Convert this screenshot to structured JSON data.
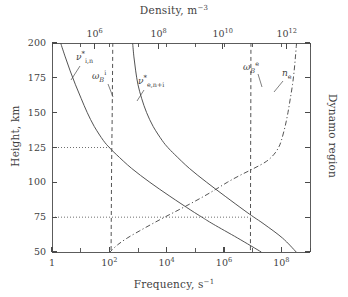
{
  "figure": {
    "background_color": "#ffffff",
    "line_color": "#4a4a4a",
    "text_color": "#3f3f3f"
  },
  "chart_data": {
    "type": "line",
    "title": "",
    "xlabel": "Frequency, s−1",
    "ylabel": "Height, km",
    "xscale": "log",
    "xlim": [
      1,
      1000000000
    ],
    "ylim": [
      50,
      200
    ],
    "grid": false,
    "legend": "inline-annotations",
    "bottom_axis": {
      "label_text": "Frequency, s",
      "label_exponent": "−1",
      "ticks": [
        {
          "value": 1,
          "label_mantissa": "1",
          "label_exponent": ""
        },
        {
          "value": 100,
          "label_mantissa": "10",
          "label_exponent": "2"
        },
        {
          "value": 10000,
          "label_mantissa": "10",
          "label_exponent": "4"
        },
        {
          "value": 1000000,
          "label_mantissa": "10",
          "label_exponent": "6"
        },
        {
          "value": 100000000,
          "label_mantissa": "10",
          "label_exponent": "8"
        }
      ]
    },
    "top_axis": {
      "label_text": "Density, m",
      "label_exponent": "−3",
      "ticks": [
        {
          "value": 1000000,
          "label_mantissa": "10",
          "label_exponent": "6"
        },
        {
          "value": 100000000,
          "label_mantissa": "10",
          "label_exponent": "8"
        },
        {
          "value": 10000000000,
          "label_mantissa": "10",
          "label_exponent": "10"
        },
        {
          "value": 1000000000000,
          "label_mantissa": "10",
          "label_exponent": "12"
        }
      ]
    },
    "left_axis": {
      "label": "Height, km",
      "ticks": [
        50,
        75,
        100,
        125,
        150,
        175,
        200
      ]
    },
    "right_axis": {
      "label": "Dynamo region"
    },
    "series": [
      {
        "name": "nu_i_n",
        "label_mantissa": "ν",
        "label_star": "*",
        "label_sub": "i,n",
        "style": "solid",
        "description": "ion-neutral collision frequency",
        "points": [
          {
            "height": 200,
            "freq": 2.0
          },
          {
            "height": 190,
            "freq": 2.9
          },
          {
            "height": 180,
            "freq": 4.3
          },
          {
            "height": 170,
            "freq": 6.6
          },
          {
            "height": 160,
            "freq": 10.5
          },
          {
            "height": 150,
            "freq": 17
          },
          {
            "height": 140,
            "freq": 30
          },
          {
            "height": 130,
            "freq": 62
          },
          {
            "height": 125,
            "freq": 100
          },
          {
            "height": 120,
            "freq": 175
          },
          {
            "height": 110,
            "freq": 600
          },
          {
            "height": 100,
            "freq": 2600
          },
          {
            "height": 90,
            "freq": 13000
          },
          {
            "height": 80,
            "freq": 70000
          },
          {
            "height": 75,
            "freq": 170000
          },
          {
            "height": 70,
            "freq": 420000
          },
          {
            "height": 60,
            "freq": 3000000
          },
          {
            "height": 50,
            "freq": 20000000
          }
        ]
      },
      {
        "name": "nu_e_n_i",
        "label_mantissa": "ν",
        "label_star": "*",
        "label_sub": "e,n+i",
        "style": "solid",
        "description": "electron collision frequency with neutrals and ions",
        "points": [
          {
            "height": 200,
            "freq": 650
          },
          {
            "height": 190,
            "freq": 720
          },
          {
            "height": 180,
            "freq": 830
          },
          {
            "height": 170,
            "freq": 1000
          },
          {
            "height": 160,
            "freq": 1350
          },
          {
            "height": 150,
            "freq": 2000
          },
          {
            "height": 140,
            "freq": 3400
          },
          {
            "height": 130,
            "freq": 7000
          },
          {
            "height": 125,
            "freq": 11000
          },
          {
            "height": 120,
            "freq": 19000
          },
          {
            "height": 110,
            "freq": 62000
          },
          {
            "height": 100,
            "freq": 250000
          },
          {
            "height": 90,
            "freq": 1100000
          },
          {
            "height": 80,
            "freq": 5000000
          },
          {
            "height": 75,
            "freq": 11000000
          },
          {
            "height": 70,
            "freq": 25000000
          },
          {
            "height": 60,
            "freq": 110000000
          },
          {
            "height": 50,
            "freq": 330000000
          }
        ]
      },
      {
        "name": "omega_B_i",
        "label_mantissa": "ω",
        "label_sub_scr": "B",
        "label_sup": "i",
        "style": "dashed",
        "description": "ion gyrofrequency",
        "constant_freq": 120,
        "points": [
          {
            "height": 200,
            "freq": 132
          },
          {
            "height": 150,
            "freq": 126
          },
          {
            "height": 125,
            "freq": 122
          },
          {
            "height": 100,
            "freq": 119
          },
          {
            "height": 75,
            "freq": 117
          },
          {
            "height": 50,
            "freq": 115
          }
        ]
      },
      {
        "name": "omega_B_e",
        "label_mantissa": "ω",
        "label_sub_scr": "B",
        "label_sup": "e",
        "style": "dashed",
        "description": "electron gyrofrequency",
        "constant_freq": 8500000,
        "points": [
          {
            "height": 200,
            "freq": 8700000
          },
          {
            "height": 150,
            "freq": 8600000
          },
          {
            "height": 125,
            "freq": 8500000
          },
          {
            "height": 100,
            "freq": 8450000
          },
          {
            "height": 75,
            "freq": 8400000
          },
          {
            "height": 50,
            "freq": 8350000
          }
        ]
      },
      {
        "name": "n_e",
        "label_mantissa": "n",
        "label_sub": "e",
        "style": "dash-dot",
        "description": "electron density, read against top Density axis",
        "points": [
          {
            "height": 200,
            "freq": 340000000
          },
          {
            "height": 190,
            "freq": 310000000
          },
          {
            "height": 180,
            "freq": 280000000
          },
          {
            "height": 170,
            "freq": 245000000
          },
          {
            "height": 160,
            "freq": 205000000
          },
          {
            "height": 150,
            "freq": 170000000
          },
          {
            "height": 140,
            "freq": 135000000
          },
          {
            "height": 130,
            "freq": 100000000
          },
          {
            "height": 125,
            "freq": 80000000
          },
          {
            "height": 120,
            "freq": 55000000
          },
          {
            "height": 115,
            "freq": 30000000
          },
          {
            "height": 110,
            "freq": 11000000
          },
          {
            "height": 105,
            "freq": 3600000
          },
          {
            "height": 100,
            "freq": 1300000
          },
          {
            "height": 95,
            "freq": 520000
          },
          {
            "height": 90,
            "freq": 200000
          },
          {
            "height": 85,
            "freq": 72000
          },
          {
            "height": 80,
            "freq": 25000
          },
          {
            "height": 75,
            "freq": 8500
          },
          {
            "height": 70,
            "freq": 3000
          },
          {
            "height": 65,
            "freq": 1100
          },
          {
            "height": 60,
            "freq": 420
          },
          {
            "height": 55,
            "freq": 190
          },
          {
            "height": 50,
            "freq": 105
          }
        ]
      }
    ],
    "guide_lines": [
      {
        "name": "guide-125",
        "height": 125,
        "style": "dotted",
        "from_freq": 1,
        "to_freq": 120
      },
      {
        "name": "guide-75",
        "height": 75,
        "style": "dotted",
        "from_freq": 1,
        "to_freq": 8500000
      }
    ],
    "annotations": [
      {
        "name": "nu-i-n-label",
        "x_px": 76,
        "y_px": 55
      },
      {
        "name": "omega-B-i-label",
        "x_px": 92,
        "y_px": 74
      },
      {
        "name": "nu-e-n-i-label",
        "x_px": 139,
        "y_px": 78
      },
      {
        "name": "omega-B-e-label",
        "x_px": 244,
        "y_px": 65
      },
      {
        "name": "n-e-label",
        "x_px": 283,
        "y_px": 70
      }
    ]
  }
}
